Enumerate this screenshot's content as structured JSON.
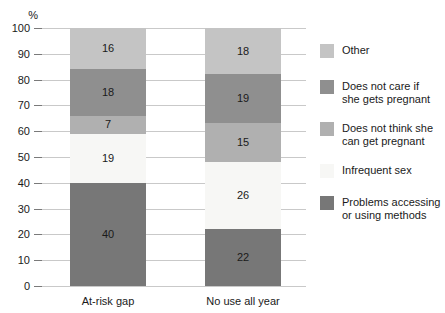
{
  "chart_data": {
    "type": "bar",
    "subtype": "stacked-bar",
    "title": "",
    "xlabel": "",
    "ylabel": "%",
    "ylim": [
      0,
      100
    ],
    "ytick_labels": [
      "0",
      "10",
      "20",
      "30",
      "40",
      "50",
      "60",
      "70",
      "80",
      "90",
      "100"
    ],
    "ytick_values": [
      0,
      10,
      20,
      30,
      40,
      50,
      60,
      70,
      80,
      90,
      100
    ],
    "grid": true,
    "legend_position": "right",
    "categories": [
      "At-risk gap",
      "No use all year"
    ],
    "series": [
      {
        "name": "Problems accessing or using methods",
        "color": "#777777",
        "values": [
          40,
          22
        ]
      },
      {
        "name": "Infrequent sex",
        "color": "#f7f7f5",
        "values": [
          19,
          26
        ]
      },
      {
        "name": "Does not think she can get pregnant",
        "color": "#b0b0b0",
        "values": [
          7,
          15
        ]
      },
      {
        "name": "Does not care if she gets pregnant",
        "color": "#8f8f8f",
        "values": [
          18,
          19
        ]
      },
      {
        "name": "Other",
        "color": "#c4c4c4",
        "values": [
          16,
          18
        ]
      }
    ],
    "legend_entries": [
      {
        "label": "Other",
        "color": "#c4c4c4"
      },
      {
        "label": "Does not care if\nshe gets pregnant",
        "color": "#8f8f8f"
      },
      {
        "label": "Does not think she\ncan get pregnant",
        "color": "#b0b0b0"
      },
      {
        "label": "Infrequent sex",
        "color": "#f7f7f5"
      },
      {
        "label": "Problems accessing\nor using methods",
        "color": "#777777"
      }
    ],
    "bar_segment_labels": {
      "At-risk gap": [
        "40",
        "19",
        "7",
        "18",
        "16"
      ],
      "No use all year": [
        "22",
        "26",
        "15",
        "19",
        "18"
      ]
    }
  },
  "axis": {
    "unit": "%",
    "ticks": [
      "100",
      "90",
      "80",
      "70",
      "60",
      "50",
      "40",
      "30",
      "20",
      "10",
      "0"
    ]
  },
  "colors": {
    "gridline": "#c9c9c9",
    "text": "#1a1a1a",
    "background": "#ffffff"
  }
}
